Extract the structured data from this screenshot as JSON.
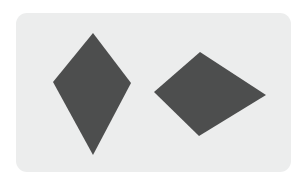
{
  "canvas": {
    "width": 306,
    "height": 185,
    "background_color": "#ffffff"
  },
  "card": {
    "name": "shape-card",
    "x": 16,
    "y": 13,
    "width": 275,
    "height": 159,
    "corner_radius": 11,
    "fill_color": "#eceded"
  },
  "shapes": [
    {
      "id": "left-kite",
      "label": "left-kite-shape",
      "kind": "kite",
      "orientation": "vertical",
      "fill_color": "#4d4e4e",
      "points": "93,33 131,83 93,155 53,82",
      "vertices": [
        {
          "name": "top-apex",
          "x": 93,
          "y": 33
        },
        {
          "name": "right-vertex",
          "x": 131,
          "y": 83
        },
        {
          "name": "bottom-tip",
          "x": 93,
          "y": 155
        },
        {
          "name": "left-vertex",
          "x": 53,
          "y": 82
        }
      ]
    },
    {
      "id": "right-kite",
      "label": "right-kite-shape",
      "kind": "kite",
      "orientation": "horizontal",
      "fill_color": "#4d4e4e",
      "points": "200,52 266,95 199,136 154,92",
      "vertices": [
        {
          "name": "top-vertex",
          "x": 200,
          "y": 52
        },
        {
          "name": "right-tip",
          "x": 266,
          "y": 95
        },
        {
          "name": "bottom-vertex",
          "x": 199,
          "y": 136
        },
        {
          "name": "left-vertex",
          "x": 154,
          "y": 92
        }
      ]
    }
  ]
}
